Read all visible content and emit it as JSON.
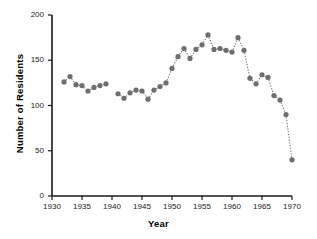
{
  "chart_data": {
    "type": "scatter",
    "title": "",
    "xlabel": "Year",
    "ylabel": "Number of Residents",
    "xlim": [
      1930,
      1970
    ],
    "ylim": [
      0,
      200
    ],
    "xticks": [
      1930,
      1935,
      1940,
      1945,
      1950,
      1955,
      1960,
      1965,
      1970
    ],
    "yticks": [
      0,
      50,
      100,
      150,
      200
    ],
    "grid": false,
    "legend": null,
    "marker_color": "#6e6e6e",
    "line_style": "dotted",
    "series": [
      {
        "name": "Number of Residents",
        "x": [
          1932,
          1933,
          1934,
          1935,
          1936,
          1937,
          1938,
          1939,
          1941,
          1942,
          1943,
          1944,
          1945,
          1946,
          1947,
          1948,
          1949,
          1950,
          1951,
          1952,
          1953,
          1954,
          1955,
          1956,
          1957,
          1958,
          1959,
          1960,
          1961,
          1962,
          1963,
          1964,
          1965,
          1966,
          1967,
          1968,
          1969,
          1970
        ],
        "values": [
          126,
          132,
          123,
          122,
          116,
          120,
          122,
          124,
          113,
          108,
          114,
          117,
          116,
          107,
          117,
          121,
          125,
          141,
          154,
          163,
          152,
          162,
          167,
          178,
          162,
          163,
          161,
          159,
          175,
          161,
          130,
          124,
          134,
          131,
          111,
          106,
          90,
          40
        ]
      }
    ]
  },
  "axes": {
    "x_axis_name": "year-axis",
    "y_axis_name": "residents-axis"
  }
}
